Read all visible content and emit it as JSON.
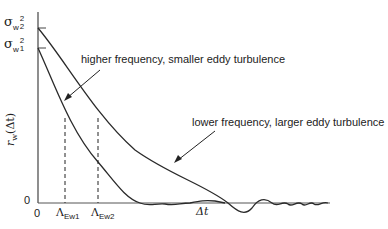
{
  "diagram": {
    "type": "autocorrelation curves",
    "y_axis": {
      "label": "r_w(Δt)",
      "label_main": "r",
      "label_sub": "w",
      "label_arg": "(Δt)",
      "ticks": {
        "sigma2": {
          "symbol": "σ",
          "sub": "w",
          "sup": "2",
          "index": "2"
        },
        "sigma1": {
          "symbol": "σ",
          "sub": "w",
          "sup": "2",
          "index": "1"
        },
        "zero": "0"
      }
    },
    "x_axis": {
      "origin": "0",
      "label": "Δt",
      "markers": [
        {
          "symbol": "Λ",
          "sub": "Ew1"
        },
        {
          "symbol": "Λ",
          "sub": "Ew2"
        }
      ]
    },
    "annotations": {
      "high": "higher frequency, smaller eddy turbulence",
      "low": "lower frequency, larger eddy turbulence"
    },
    "colors": {
      "line": "#2a2a2a",
      "axis": "#444444"
    }
  }
}
